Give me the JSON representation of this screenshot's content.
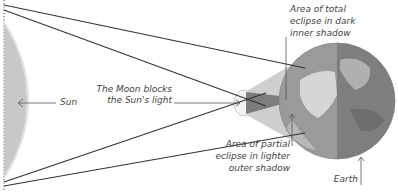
{
  "diagram": {
    "labels": {
      "sun": "Sun",
      "moon_line1": "The Moon blocks",
      "moon_line2": "the Sun's light",
      "umbra_line1": "Area of total",
      "umbra_line2": "eclipse in dark",
      "umbra_line3": "inner shadow",
      "penumbra_line1": "Area of partial",
      "penumbra_line2": "eclipse in lighter",
      "penumbra_line3": "outer shadow",
      "earth": "Earth"
    },
    "colors": {
      "sun": "#c8c8c8",
      "moon": "#f2f2f2",
      "penumbra": "#c9c9c9",
      "umbra": "#7d7d7d",
      "earth_ocean": "#9a9a9a",
      "earth_land": "#d6d6d6",
      "earth_dark": "#7a7a7a",
      "lines": "#333333",
      "text": "#444444"
    }
  }
}
